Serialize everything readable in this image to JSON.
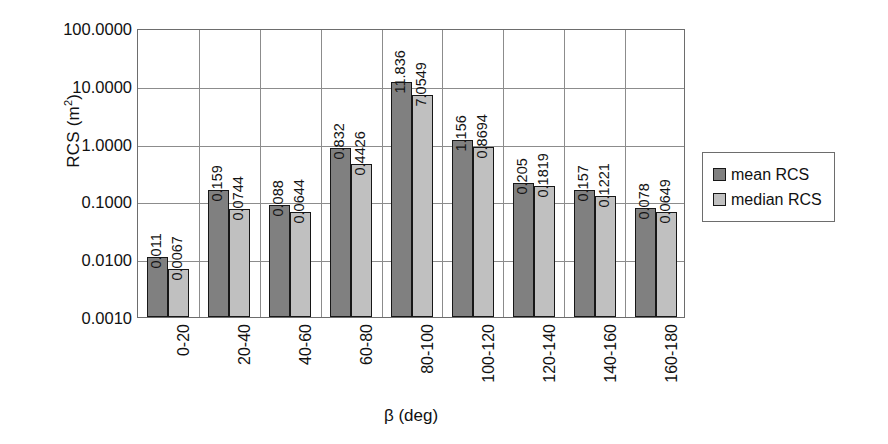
{
  "chart_data": {
    "type": "bar",
    "title": "",
    "xlabel": "β (deg)",
    "ylabel": "RCS (m²)",
    "ylabel_base": "RCS (m",
    "ylabel_sup": "2",
    "ylabel_close": ")",
    "yscale": "log",
    "ylim": [
      0.001,
      100
    ],
    "grid": "horizontal-and-vertical",
    "legend_position": "right",
    "categories": [
      "0-20",
      "20-40",
      "40-60",
      "60-80",
      "80-100",
      "100-120",
      "120-140",
      "140-160",
      "160-180"
    ],
    "ytick_labels": [
      "100.0000",
      "10.0000",
      "1.0000",
      "0.1000",
      "0.0100",
      "0.0010"
    ],
    "ytick_values": [
      100,
      10,
      1,
      0.1,
      0.01,
      0.001
    ],
    "series": [
      {
        "name": "mean RCS",
        "color": "#808080",
        "values": [
          0.011,
          0.159,
          0.088,
          0.832,
          11.836,
          1.156,
          0.205,
          0.157,
          0.078
        ],
        "labels": [
          "0.011",
          "0.159",
          "0.088",
          "0.832",
          "11.836",
          "1.156",
          "0.205",
          "0.157",
          "0.078"
        ]
      },
      {
        "name": "median RCS",
        "color": "#c0c0c0",
        "values": [
          0.0067,
          0.0744,
          0.0644,
          0.4426,
          7.0549,
          0.8694,
          0.1819,
          0.1221,
          0.0649
        ],
        "labels": [
          "0.0067",
          "0.0744",
          "0.0644",
          "0.4426",
          "7.0549",
          "0.8694",
          "0.1819",
          "0.1221",
          "0.0649"
        ]
      }
    ]
  },
  "legend": {
    "items": [
      {
        "label": "mean RCS",
        "swatch": "mean"
      },
      {
        "label": "median RCS",
        "swatch": "median"
      }
    ]
  }
}
